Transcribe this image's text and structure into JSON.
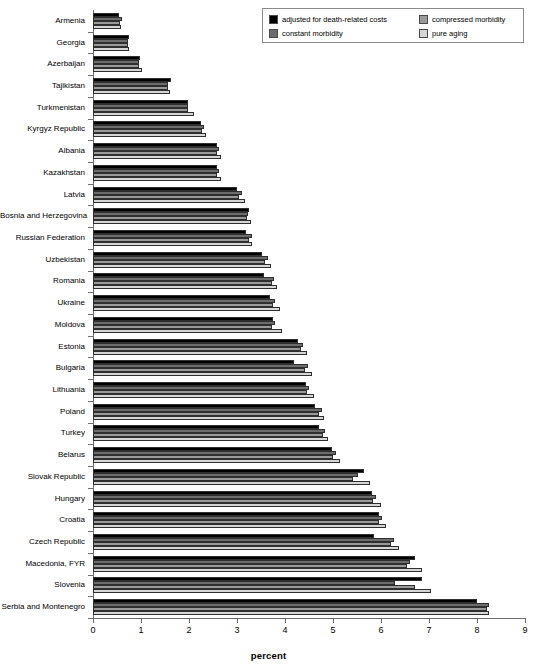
{
  "chart_data": {
    "type": "bar",
    "orientation": "horizontal",
    "title": "",
    "xlabel": "percent",
    "ylabel": "",
    "xlim": [
      0,
      9
    ],
    "xticks": [
      0,
      1,
      2,
      3,
      4,
      5,
      6,
      7,
      8,
      9
    ],
    "xticklabels": [
      "0",
      "1",
      "2",
      "3",
      "4",
      "5",
      "6",
      "7",
      "8",
      "9"
    ],
    "grid": false,
    "legend_position": "top-right",
    "categories": [
      "Armenia",
      "Georgia",
      "Azerbaijan",
      "Tajikistan",
      "Turkmenistan",
      "Kyrgyz Republic",
      "Albania",
      "Kazakhstan",
      "Latvia",
      "Bosnia and Herzegovina",
      "Russian Federation",
      "Uzbekistan",
      "Romania",
      "Ukraine",
      "Moldova",
      "Estonia",
      "Bulgaria",
      "Lithuania",
      "Poland",
      "Turkey",
      "Belarus",
      "Slovak Republic",
      "Hungary",
      "Croatia",
      "Czech Republic",
      "Macedonia, FYR",
      "Slovenia",
      "Serbia and Montenegro"
    ],
    "series": [
      {
        "name": "adjusted for death-related costs",
        "color": "#000000",
        "values": [
          0.55,
          0.75,
          0.98,
          1.62,
          1.97,
          2.26,
          2.59,
          2.59,
          3.0,
          3.26,
          3.18,
          3.53,
          3.56,
          3.68,
          3.76,
          4.28,
          4.18,
          4.43,
          4.62,
          4.7,
          4.98,
          5.64,
          5.82,
          5.96,
          5.86,
          6.7,
          6.85,
          8.0
        ]
      },
      {
        "name": "compressed morbidity",
        "color": "#6d6d6d",
        "values": [
          0.6,
          0.72,
          0.96,
          1.57,
          1.98,
          2.31,
          2.63,
          2.63,
          3.1,
          3.23,
          3.32,
          3.65,
          3.77,
          3.8,
          3.8,
          4.38,
          4.48,
          4.51,
          4.77,
          4.84,
          5.06,
          5.52,
          5.89,
          6.03,
          6.27,
          6.6,
          6.3,
          8.25
        ]
      },
      {
        "name": "constant morbidity",
        "color": "#9a9a9a",
        "values": [
          0.57,
          0.72,
          0.96,
          1.56,
          1.98,
          2.28,
          2.59,
          2.59,
          3.05,
          3.21,
          3.26,
          3.59,
          3.72,
          3.75,
          3.72,
          4.33,
          4.42,
          4.46,
          4.71,
          4.79,
          5.01,
          5.42,
          5.84,
          5.96,
          6.21,
          6.55,
          6.7,
          8.2
        ]
      },
      {
        "name": "pure aging",
        "color": "#d6d6d6",
        "values": [
          0.58,
          0.74,
          1.02,
          1.6,
          2.1,
          2.36,
          2.66,
          2.66,
          3.16,
          3.29,
          3.32,
          3.7,
          3.84,
          3.9,
          3.93,
          4.45,
          4.56,
          4.6,
          4.81,
          4.9,
          5.15,
          5.78,
          6.0,
          6.1,
          6.38,
          6.85,
          7.05,
          8.25
        ]
      }
    ]
  },
  "legend": {
    "entries": [
      {
        "label": "adjusted for death-related costs",
        "color": "#000000"
      },
      {
        "label": "compressed morbidity",
        "color": "#9a9a9a"
      },
      {
        "label": "constant morbidity",
        "color": "#6d6d6d"
      },
      {
        "label": "pure aging",
        "color": "#d6d6d6"
      }
    ]
  },
  "axis": {
    "x_title": "percent"
  },
  "colors": {
    "axis": "#6e6e6e",
    "text": "#000000",
    "background": "#ffffff"
  }
}
